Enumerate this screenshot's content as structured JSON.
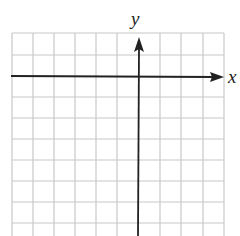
{
  "diagram": {
    "type": "coordinate-plane",
    "x_axis_label": "x",
    "y_axis_label": "y",
    "grid": {
      "columns": 10,
      "rows_visible": 9,
      "cell_size_px": 21,
      "line_color": "#c8c8c8",
      "axis_color": "#222222"
    },
    "origin_column": 6,
    "origin_row": 2
  }
}
